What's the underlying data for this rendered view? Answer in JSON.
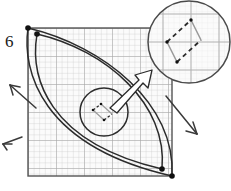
{
  "figure": {
    "title": "",
    "background_color": "#ffffff",
    "width": 231,
    "height": 191
  },
  "labels": {
    "corner_value": "6"
  },
  "colors": {
    "grid_minor": "#c9c9c9",
    "grid_major": "#a8a8a8",
    "curve": "#2b2b2b",
    "square_border": "#555555",
    "arrow": "#3a3a3a",
    "dashed_detail": "#2b2b2b",
    "solid_detail": "#9a9a9a",
    "magnifier_border": "#4a4a4a",
    "callout_fill": "#ffffff",
    "point": "#111111"
  },
  "grid": {
    "x": 28,
    "y": 28,
    "width": 144,
    "height": 148,
    "minor_step": 5.6,
    "major_step": 28,
    "visible": true
  },
  "points": [
    {
      "name": "outer-top-left",
      "x": 28,
      "y": 28
    },
    {
      "name": "inner-top-left",
      "x": 37,
      "y": 34
    },
    {
      "name": "inner-bottom-right",
      "x": 162,
      "y": 169
    },
    {
      "name": "outer-bottom-right",
      "x": 172,
      "y": 176
    }
  ],
  "curves": [
    {
      "name": "outer-envelope-left",
      "from": "outer-top-left",
      "to": "outer-bottom-right",
      "bow": "left"
    },
    {
      "name": "outer-envelope-right",
      "from": "outer-top-left",
      "to": "outer-bottom-right",
      "bow": "right"
    },
    {
      "name": "inner-envelope-left",
      "from": "inner-top-left",
      "to": "inner-bottom-right",
      "bow": "left"
    },
    {
      "name": "inner-envelope-right",
      "from": "inner-top-left",
      "to": "inner-bottom-right",
      "bow": "right"
    }
  ],
  "arrows": [
    {
      "name": "arrow-upper-left",
      "direction": "up-left"
    },
    {
      "name": "arrow-lower-left",
      "direction": "down-left"
    },
    {
      "name": "arrow-lower-right",
      "direction": "down-right"
    }
  ],
  "magnifier": {
    "source": {
      "cx": 104,
      "cy": 112,
      "r": 24
    },
    "lens": {
      "cx": 189,
      "cy": 42,
      "r": 41
    },
    "callout_label": "detail",
    "detail": {
      "dashed_sides": 2,
      "solid_sides": 2,
      "vertices": 3,
      "shape": "rhombus"
    }
  }
}
